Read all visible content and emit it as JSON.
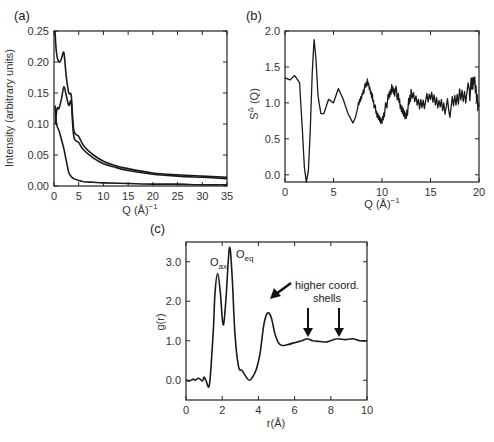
{
  "chart_data": [
    {
      "panel": "(a)",
      "type": "line",
      "title": "",
      "xlabel": "Q (Å)⁻¹",
      "ylabel": "Intensity (arbitrary units)",
      "xlim": [
        0,
        35
      ],
      "ylim": [
        0,
        0.25
      ],
      "xticks": [
        0,
        5,
        10,
        15,
        20,
        25,
        30,
        35
      ],
      "yticks": [
        0.0,
        0.05,
        0.1,
        0.15,
        0.2,
        0.25
      ],
      "ytick_labels": [
        "0.00",
        "0.05",
        "0.10",
        "0.15",
        "0.20",
        "0.25"
      ],
      "grid": false,
      "series": [
        {
          "name": "upper curve",
          "x": [
            0.2,
            0.5,
            1.0,
            1.5,
            2.0,
            2.5,
            3.0,
            3.5,
            4.0,
            5.0,
            6.0,
            8.0,
            10.0,
            12.0,
            15.0,
            20.0,
            25.0,
            30.0,
            35.0
          ],
          "y": [
            0.25,
            0.215,
            0.2,
            0.205,
            0.215,
            0.175,
            0.15,
            0.145,
            0.09,
            0.08,
            0.065,
            0.05,
            0.04,
            0.034,
            0.028,
            0.021,
            0.018,
            0.016,
            0.014
          ]
        },
        {
          "name": "middle curve",
          "x": [
            0.3,
            0.6,
            1.0,
            1.5,
            2.0,
            2.5,
            3.0,
            3.5,
            4.0,
            5.0,
            6.0,
            8.0,
            10.0,
            12.0,
            15.0,
            20.0,
            25.0,
            30.0,
            35.0
          ],
          "y": [
            0.1,
            0.125,
            0.125,
            0.14,
            0.16,
            0.145,
            0.13,
            0.135,
            0.08,
            0.07,
            0.058,
            0.045,
            0.036,
            0.031,
            0.025,
            0.019,
            0.016,
            0.014,
            0.012
          ]
        },
        {
          "name": "lower curve",
          "x": [
            0.2,
            0.5,
            1.0,
            1.5,
            2.0,
            2.5,
            3.0,
            3.5,
            4.0,
            5.0,
            6.0,
            8.0,
            10.0,
            15.0,
            20.0,
            25.0,
            30.0,
            35.0
          ],
          "y": [
            0.13,
            0.1,
            0.09,
            0.075,
            0.06,
            0.04,
            0.022,
            0.015,
            0.012,
            0.009,
            0.007,
            0.006,
            0.005,
            0.004,
            0.003,
            0.003,
            0.002,
            0.002
          ]
        }
      ]
    },
    {
      "panel": "(b)",
      "type": "line",
      "title": "",
      "xlabel": "Q (Å)⁻¹",
      "ylabel": "S^Δ (Q)",
      "xlim": [
        0,
        20
      ],
      "ylim": [
        -0.1,
        2.0
      ],
      "xticks": [
        0,
        5,
        10,
        15,
        20
      ],
      "yticks": [
        0.0,
        0.5,
        1.0,
        1.5,
        2.0
      ],
      "ytick_labels": [
        "0.0",
        "0.5",
        "1.0",
        "1.5",
        "2.0"
      ],
      "grid": false,
      "series": [
        {
          "name": "S^Δ(Q)",
          "x": [
            0,
            0.5,
            1.0,
            1.5,
            1.8,
            2.0,
            2.2,
            2.4,
            2.6,
            2.8,
            3.0,
            3.2,
            3.4,
            3.7,
            4.0,
            4.5,
            5.0,
            5.5,
            6.0,
            6.5,
            7.0,
            7.5,
            8.0,
            8.5,
            9.0,
            9.5,
            10.0,
            10.5,
            11.0,
            11.5,
            12.0,
            12.5,
            13.0,
            14.0,
            15.0,
            16.0,
            17.0,
            18.0,
            19.0,
            19.5,
            20.0
          ],
          "y": [
            1.35,
            1.32,
            1.38,
            1.28,
            0.6,
            0.1,
            -0.1,
            0.05,
            0.6,
            1.4,
            1.88,
            1.6,
            1.1,
            0.85,
            0.85,
            1.05,
            1.0,
            1.2,
            1.05,
            0.85,
            0.72,
            0.95,
            1.15,
            1.28,
            1.1,
            0.8,
            0.75,
            1.0,
            1.2,
            1.15,
            0.9,
            0.85,
            1.1,
            1.0,
            1.05,
            1.0,
            0.92,
            1.1,
            1.15,
            1.3,
            0.95
          ]
        }
      ]
    },
    {
      "panel": "(c)",
      "type": "line",
      "title": "",
      "xlabel": "r(Å)",
      "ylabel": "g(r)",
      "xlim": [
        0,
        10
      ],
      "ylim": [
        -0.5,
        3.5
      ],
      "xticks": [
        0,
        2,
        4,
        6,
        8,
        10
      ],
      "yticks": [
        0.0,
        1.0,
        2.0,
        3.0
      ],
      "ytick_labels": [
        "0.0",
        "1.0",
        "2.0",
        "3.0"
      ],
      "grid": false,
      "annotations": [
        {
          "text": "O_ax",
          "x": 1.75,
          "y": 2.7
        },
        {
          "text": "O_eq",
          "x": 2.4,
          "y": 3.35
        },
        {
          "text": "higher coord. shells",
          "arrows_at_x": [
            6.7,
            8.4
          ]
        },
        {
          "text": "arrow",
          "points_to_x": 4.5,
          "points_to_y": 1.7
        }
      ],
      "series": [
        {
          "name": "g(r)",
          "x": [
            0,
            0.2,
            0.4,
            0.5,
            0.7,
            0.9,
            1.0,
            1.1,
            1.3,
            1.5,
            1.6,
            1.75,
            1.9,
            2.05,
            2.2,
            2.4,
            2.55,
            2.7,
            2.9,
            3.1,
            3.3,
            3.5,
            3.7,
            3.9,
            4.1,
            4.3,
            4.5,
            4.7,
            4.9,
            5.1,
            5.3,
            5.6,
            6.0,
            6.4,
            6.7,
            7.0,
            7.4,
            7.8,
            8.1,
            8.4,
            8.8,
            9.2,
            9.6,
            10.0
          ],
          "y": [
            0.0,
            -0.02,
            0.03,
            0.0,
            0.05,
            -0.02,
            0.08,
            0.0,
            -0.1,
            1.2,
            2.2,
            2.7,
            2.2,
            1.4,
            2.0,
            3.35,
            2.6,
            1.2,
            0.35,
            0.25,
            0.1,
            0.0,
            0.1,
            0.3,
            0.7,
            1.4,
            1.7,
            1.6,
            1.2,
            0.95,
            0.88,
            0.9,
            0.95,
            1.0,
            1.05,
            1.0,
            0.98,
            0.97,
            1.02,
            1.05,
            1.03,
            1.05,
            1.0,
            1.0
          ]
        }
      ]
    }
  ],
  "labels": {
    "panel_a": "(a)",
    "panel_b": "(b)",
    "panel_c": "(c)",
    "a_xlabel": "Q (Å)",
    "a_xlabel_sup": "−1",
    "a_ylabel": "Intensity (arbitrary units)",
    "b_xlabel": "Q (Å)",
    "b_xlabel_sup": "−1",
    "b_ylabel": "S",
    "b_ylabel_sup": "Δ",
    "b_ylabel_tail": " (Q)",
    "c_xlabel": "r(Å)",
    "c_ylabel": "g(r)",
    "c_oax": "O",
    "c_oax_sub": "ax",
    "c_oeq": "O",
    "c_oeq_sub": "eq",
    "c_shells_line1": "higher coord.",
    "c_shells_line2": "shells"
  },
  "ticks": {
    "a_x": [
      "0",
      "5",
      "10",
      "15",
      "20",
      "25",
      "30",
      "35"
    ],
    "a_y": [
      "0.00",
      "0.05",
      "0.10",
      "0.15",
      "0.20",
      "0.25"
    ],
    "b_x": [
      "0",
      "5",
      "10",
      "15",
      "20"
    ],
    "b_y": [
      "0.0",
      "0.5",
      "1.0",
      "1.5",
      "2.0"
    ],
    "c_x": [
      "0",
      "2",
      "4",
      "6",
      "8",
      "10"
    ],
    "c_y": [
      "0.0",
      "1.0",
      "2.0",
      "3.0"
    ]
  }
}
